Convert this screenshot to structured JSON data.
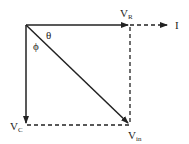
{
  "diagram": {
    "type": "phasor-diagram",
    "labels": {
      "v_r": {
        "main": "V",
        "sub": "R"
      },
      "current": "I",
      "v_c": {
        "main": "V",
        "sub": "C"
      },
      "v_in": {
        "main": "V",
        "sub": "in"
      },
      "theta": "θ",
      "phi": "ϕ"
    },
    "colors": {
      "line": "#222222",
      "background": "#ffffff"
    }
  }
}
